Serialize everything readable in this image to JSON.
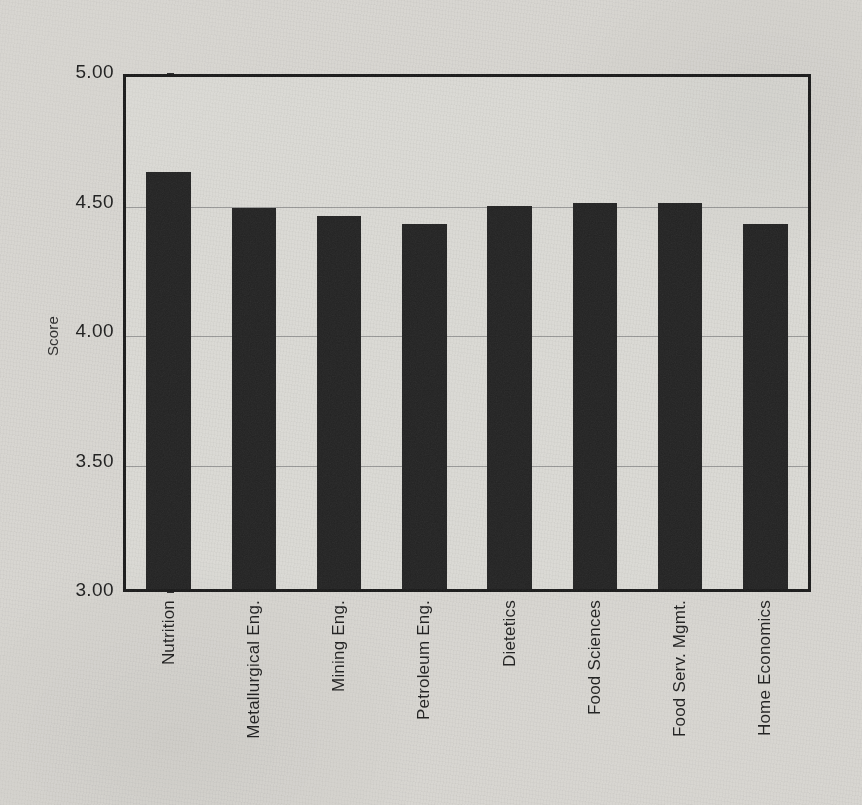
{
  "chart_data": {
    "type": "bar",
    "title": "",
    "subtitle": "",
    "xlabel": "",
    "ylabel": "Score",
    "ylim": [
      3.0,
      5.0
    ],
    "ytick_labels": [
      "5.00",
      "4.50",
      "4.00",
      "3.50",
      "3.00"
    ],
    "ytick_values": [
      5.0,
      4.5,
      4.0,
      3.5,
      3.0
    ],
    "grid": true,
    "gridlines_at": [
      4.5,
      4.0,
      3.5
    ],
    "legend": null,
    "legend_position": "none",
    "bar_color": "#232323",
    "categories": [
      "Nutrition",
      "Metallurgical Eng.",
      "Mining Eng.",
      "Petroleum Eng.",
      "Dietetics",
      "Food Sciences",
      "Food Serv. Mgmt.",
      "Home Economics"
    ],
    "values": [
      4.61,
      4.47,
      4.44,
      4.41,
      4.48,
      4.49,
      4.49,
      4.41
    ],
    "annotations": []
  },
  "axes": {
    "y_title": "Score"
  },
  "colors": {
    "background": "#d9d7d2",
    "bar": "#232323",
    "frame": "#1a1a1a",
    "gridline": "#8d8d8d",
    "text": "#1d1d1d"
  }
}
